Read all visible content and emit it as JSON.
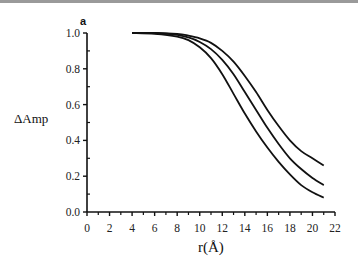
{
  "chart_data": {
    "type": "line",
    "panel_label": "a",
    "title": "",
    "xlabel": "r(Å)",
    "ylabel": "ΔAmp",
    "xlim": [
      0,
      22
    ],
    "ylim": [
      0.0,
      1.0
    ],
    "xticks": [
      "0",
      "2",
      "4",
      "6",
      "8",
      "10",
      "12",
      "14",
      "16",
      "18",
      "20",
      "22"
    ],
    "yticks": [
      "0.0",
      "0.2",
      "0.4",
      "0.6",
      "0.8",
      "1.0"
    ],
    "grid": false,
    "legend": null,
    "series": [
      {
        "name": "curve-1 (top)",
        "x": [
          4,
          6,
          8,
          9,
          10,
          11,
          12,
          13,
          14,
          15,
          16,
          17,
          18,
          19,
          20,
          21
        ],
        "y": [
          1.0,
          1.0,
          0.995,
          0.985,
          0.97,
          0.945,
          0.9,
          0.84,
          0.76,
          0.67,
          0.57,
          0.48,
          0.4,
          0.34,
          0.3,
          0.26
        ]
      },
      {
        "name": "curve-2 (middle)",
        "x": [
          4,
          6,
          8,
          9,
          10,
          11,
          12,
          13,
          14,
          15,
          16,
          17,
          18,
          19,
          20,
          21
        ],
        "y": [
          1.0,
          1.0,
          0.99,
          0.975,
          0.95,
          0.91,
          0.85,
          0.77,
          0.67,
          0.57,
          0.47,
          0.38,
          0.3,
          0.24,
          0.19,
          0.15
        ]
      },
      {
        "name": "curve-3 (bottom)",
        "x": [
          4,
          6,
          8,
          9,
          10,
          11,
          12,
          13,
          14,
          15,
          16,
          17,
          18,
          19,
          20,
          21
        ],
        "y": [
          1.0,
          0.995,
          0.98,
          0.96,
          0.92,
          0.86,
          0.77,
          0.66,
          0.55,
          0.45,
          0.36,
          0.28,
          0.21,
          0.15,
          0.11,
          0.08
        ]
      }
    ]
  }
}
